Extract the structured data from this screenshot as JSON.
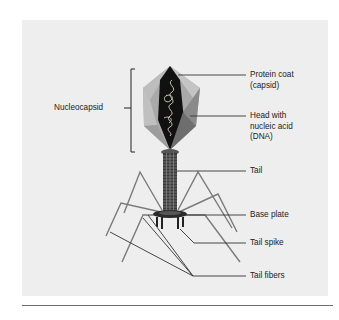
{
  "figure": {
    "labels": {
      "nucleocapsid": "Nucleocapsid",
      "protein_coat": "Protein coat\n(capsid)",
      "head": "Head with\nnucleic acid\n(DNA)",
      "tail": "Tail",
      "base_plate": "Base plate",
      "tail_spike": "Tail spike",
      "tail_fibers": "Tail fibers"
    },
    "colors": {
      "panel": "#eeeeee",
      "capsid_light": "#b8b8b8",
      "capsid_mid": "#8e8e8e",
      "capsid_dark": "#111111",
      "leader_line": "#333333",
      "fiber": "#777777"
    }
  }
}
